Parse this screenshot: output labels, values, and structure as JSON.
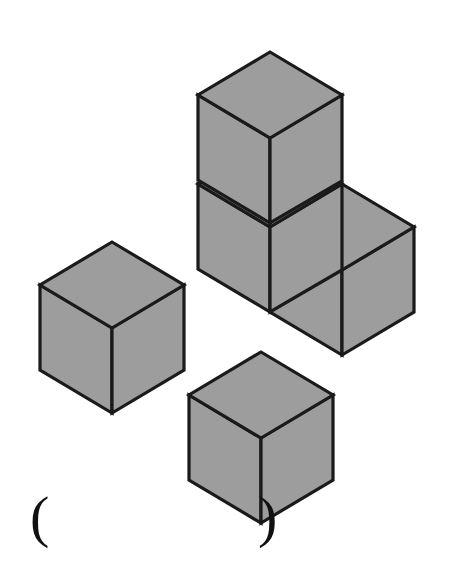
{
  "page": {
    "width": 450,
    "height": 585,
    "background": "#ffffff"
  },
  "figure": {
    "total_cubes": 5,
    "style": {
      "top_face_fill": "#9d9d9d",
      "left_face_fill": "#9d9d9d",
      "right_face_fill": "#9d9d9d",
      "stroke": "#1a1a1a",
      "stroke_width": 3.2
    },
    "geometry": {
      "half_width": 72,
      "half_height": 43,
      "vertical_edge": 84
    },
    "groups": [
      {
        "name": "l-shaped-stack",
        "cube_count": 3,
        "cubes": [
          {
            "name": "stack-cube-upper",
            "top_apex_x": 270,
            "top_apex_y": 52
          },
          {
            "name": "stack-cube-lower-left",
            "top_apex_x": 270,
            "top_apex_y": 184
          },
          {
            "name": "stack-cube-lower-right",
            "top_apex_x": 342,
            "top_apex_y": 184
          }
        ]
      },
      {
        "name": "single-cube-left",
        "cube_count": 1,
        "cubes": [
          {
            "name": "left-cube",
            "top_apex_x": 112,
            "top_apex_y": 242
          }
        ]
      },
      {
        "name": "single-cube-bottom",
        "cube_count": 1,
        "cubes": [
          {
            "name": "bottom-cube",
            "top_apex_x": 261,
            "top_apex_y": 352
          }
        ]
      }
    ]
  },
  "answer": {
    "open_paren": "(",
    "close_paren": ")",
    "value": "",
    "display": "(      )"
  }
}
